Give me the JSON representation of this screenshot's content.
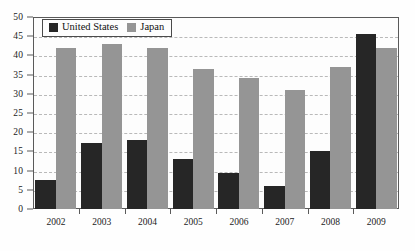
{
  "chart_data": {
    "type": "bar",
    "title": "",
    "xlabel": "",
    "ylabel": "",
    "ylim": [
      0,
      50
    ],
    "ytick_step": 5,
    "yticks": [
      0,
      5,
      10,
      15,
      20,
      25,
      30,
      35,
      40,
      45,
      50
    ],
    "ytick_labels": [
      "0",
      "5",
      "10",
      "15",
      "20",
      "25",
      "30",
      "35",
      "40",
      "45",
      "50"
    ],
    "grid": true,
    "grid_axis": "y",
    "grid_style": "dashed",
    "legend_position": "top-left",
    "categories": [
      "2002",
      "2003",
      "2004",
      "2005",
      "2006",
      "2007",
      "2008",
      "2009"
    ],
    "series": [
      {
        "name": "United States",
        "color": "#262626",
        "values": [
          7.5,
          17.3,
          18.0,
          13.0,
          9.3,
          6.0,
          15.2,
          45.5
        ]
      },
      {
        "name": "Japan",
        "color": "#959595",
        "values": [
          42.0,
          43.0,
          42.0,
          36.5,
          34.0,
          31.0,
          37.0,
          42.0
        ]
      }
    ]
  },
  "legend": {
    "entries": [
      {
        "label": "United States",
        "swatch": "us"
      },
      {
        "label": "Japan",
        "swatch": "jp"
      }
    ]
  },
  "colors": {
    "united_states": "#262626",
    "japan": "#959595",
    "axis": "#5a5a5a",
    "gridline": "#b9b9b9",
    "background": "#fefefe"
  }
}
